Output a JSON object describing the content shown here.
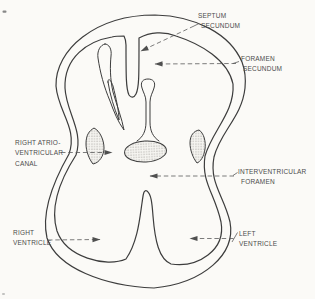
{
  "figure": {
    "background_color": "#fbfaf7",
    "line_color": "#3d3d3d",
    "leader_color": "#5b5b5b",
    "text_color": "#4c4c4c",
    "labels": {
      "septum_secundum": {
        "lines": [
          "SEPTUM",
          "SECUNDUM"
        ]
      },
      "foramen_secundum": {
        "lines": [
          "FORAMEN",
          "SECUNDUM"
        ]
      },
      "right_atrioventricular_canal": {
        "lines": [
          "RIGHT ATRIO-",
          "VENTRICULAR",
          "CANAL"
        ]
      },
      "interventricular_foramen": {
        "lines": [
          "INTERVENTRICULAR",
          "FORAMEN"
        ]
      },
      "right_ventricle": {
        "lines": [
          "RIGHT",
          "VENTRICLE"
        ]
      },
      "left_ventricle": {
        "lines": [
          "LEFT",
          "VENTRICLE"
        ]
      }
    }
  }
}
